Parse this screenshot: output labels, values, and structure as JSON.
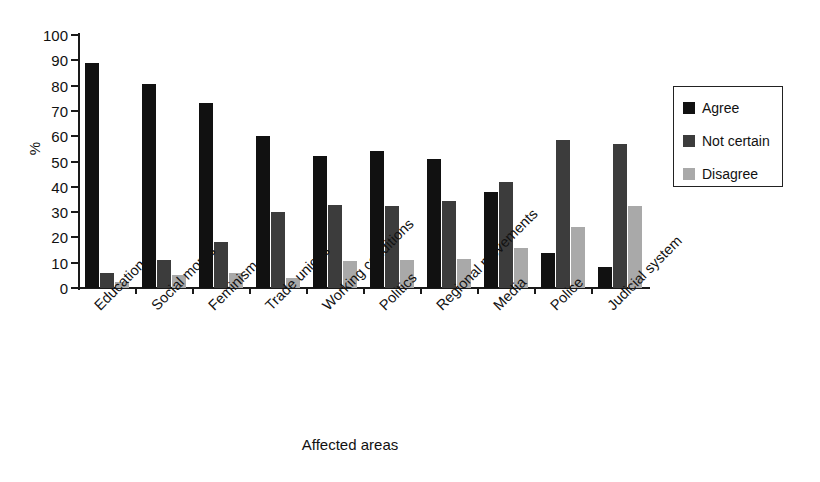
{
  "chart_data": {
    "type": "bar",
    "title": "",
    "xlabel": "Affected areas",
    "ylabel": "%",
    "ylim": [
      0,
      100
    ],
    "yticks": [
      0,
      10,
      20,
      30,
      40,
      50,
      60,
      70,
      80,
      90,
      100
    ],
    "grid": false,
    "legend_position": "right",
    "categories": [
      "Education",
      "Social mores",
      "Feminism",
      "Trade unions",
      "Working conditions",
      "Politics",
      "Regional movements",
      "Media",
      "Police",
      "Judicial system"
    ],
    "series": [
      {
        "name": "Agree",
        "color": "#111111",
        "values": [
          89,
          80.5,
          73,
          60,
          52,
          54,
          51,
          38,
          14,
          8.5
        ]
      },
      {
        "name": "Not certain",
        "color": "#3c3c3c",
        "values": [
          6,
          11,
          18,
          30,
          33,
          32.5,
          34.5,
          42,
          58.5,
          57
        ]
      },
      {
        "name": "Disagree",
        "color": "#a9a9a9",
        "values": [
          2.5,
          5,
          6,
          4,
          10.5,
          11,
          11.5,
          16,
          24,
          32.5
        ]
      }
    ]
  },
  "legend": {
    "items": [
      {
        "label": "Agree",
        "swatch": "series-0-swatch"
      },
      {
        "label": "Not certain",
        "swatch": "series-1-swatch"
      },
      {
        "label": "Disagree",
        "swatch": "series-2-swatch"
      }
    ]
  }
}
